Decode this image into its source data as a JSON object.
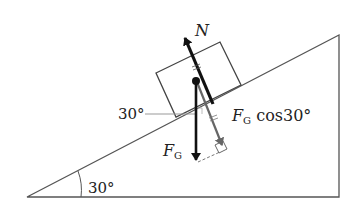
{
  "diagram": {
    "incline_angle_label": "30°",
    "normal_force_label": "N",
    "gravity_force_label": "F",
    "gravity_subscript": "G",
    "component_label_F": "F",
    "component_label_sub": "G",
    "component_label_rest": " cos30°",
    "angle_between_label": "30°",
    "colors": {
      "line": "#555555",
      "arrow_dark": "#111111",
      "arrow_gray": "#666666",
      "helper": "#999999"
    }
  }
}
